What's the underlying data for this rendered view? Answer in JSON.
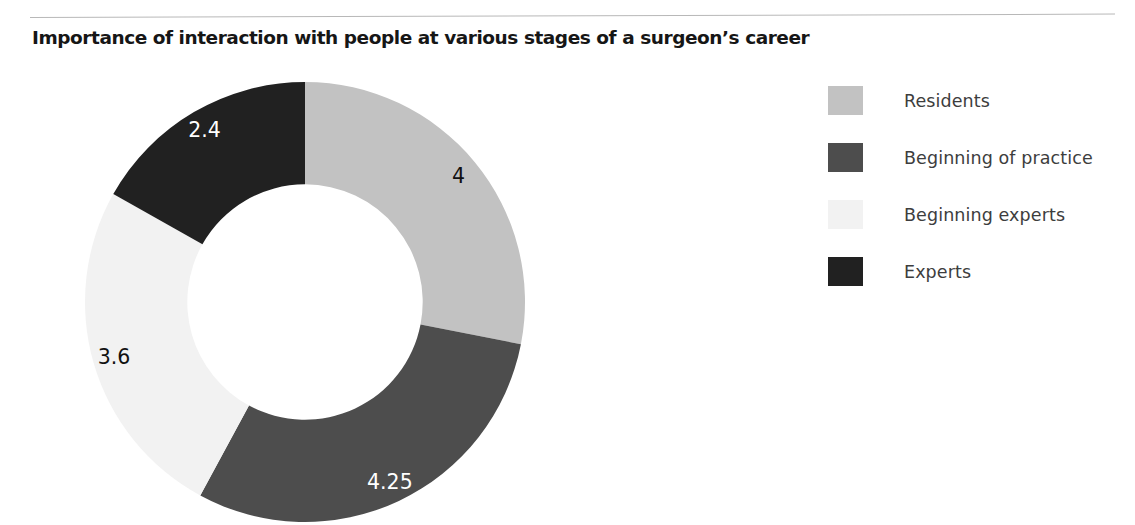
{
  "header": {
    "title": "Importance of interaction with people at various stages of a surgeon’s career",
    "rule": "horizontal-rule"
  },
  "legend": {
    "position": "right",
    "items": [
      {
        "label": "Residents",
        "color": "#c2c2c2",
        "swatch": "legend-swatch-residents"
      },
      {
        "label": "Beginning of practice",
        "color": "#4d4d4d",
        "swatch": "legend-swatch-beginning-of-practice"
      },
      {
        "label": "Beginning experts",
        "color": "#f2f2f2",
        "swatch": "legend-swatch-beginning-experts"
      },
      {
        "label": "Experts",
        "color": "#212121",
        "swatch": "legend-swatch-experts"
      }
    ]
  },
  "labels": {
    "residents": "4",
    "beginning_of_practice": "4.25",
    "beginning_experts": "3.6",
    "experts": "2.4"
  },
  "chart_data": {
    "type": "pie",
    "variant": "donut",
    "title": "Importance of interaction with people at various stages of a surgeon’s career",
    "categories": [
      "Residents",
      "Beginning of practice",
      "Beginning experts",
      "Experts"
    ],
    "values": [
      4,
      4.25,
      3.6,
      2.4
    ],
    "value_labels": [
      "4",
      "4.25",
      "3.6",
      "2.4"
    ],
    "colors": [
      "#c2c2c2",
      "#4d4d4d",
      "#f2f2f2",
      "#212121"
    ],
    "label_colors": [
      "#111111",
      "#ffffff",
      "#111111",
      "#ffffff"
    ],
    "total": 14.25,
    "start_angle_deg": 0,
    "direction": "clockwise",
    "inner_radius_ratio": 0.535,
    "xlabel": "",
    "ylabel": "",
    "grid": false,
    "legend_position": "right"
  }
}
